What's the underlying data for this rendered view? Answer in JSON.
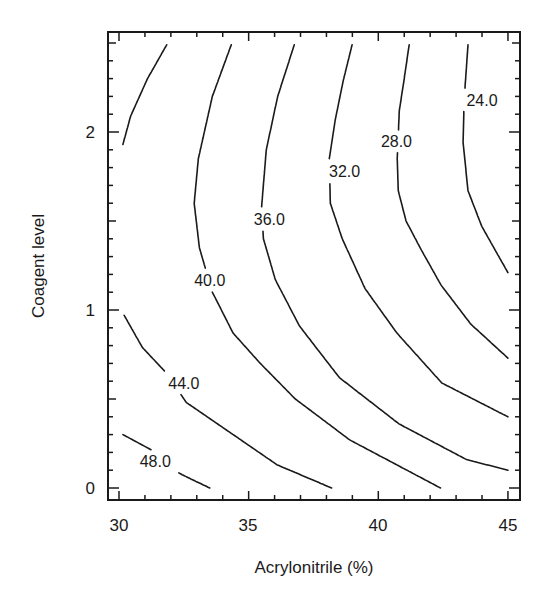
{
  "chart_data": {
    "type": "contour",
    "title": "",
    "xlabel": "Acrylonitrile (%)",
    "ylabel": "Coagent level",
    "xlim": [
      29.6,
      45.45
    ],
    "ylim": [
      -0.07,
      2.56
    ],
    "x_ticks": [
      30,
      35,
      40,
      45
    ],
    "x_tick_labels": [
      "30",
      "35",
      "40",
      "45"
    ],
    "x_minor_step": 1,
    "y_ticks": [
      0,
      1,
      2
    ],
    "y_tick_labels": [
      "0",
      "1",
      "2"
    ],
    "y_minor_step": 0.1,
    "y_mid_ticks": [
      0.5,
      1.5,
      2.5
    ],
    "grid": false,
    "legend": "none",
    "contour_levels": [
      24.0,
      28.0,
      32.0,
      36.0,
      40.0,
      44.0,
      48.0
    ],
    "contour_labels": [
      "24.0",
      "28.0",
      "32.0",
      "36.0",
      "40.0",
      "44.0",
      "48.0"
    ],
    "contours": [
      {
        "level": 24.0,
        "label": "24.0",
        "label_at": [
          44.0,
          2.18
        ],
        "points": [
          [
            43.46,
            2.49
          ],
          [
            43.31,
            2.18
          ],
          [
            43.27,
            1.94
          ],
          [
            43.46,
            1.67
          ],
          [
            43.99,
            1.47
          ],
          [
            44.61,
            1.31
          ],
          [
            45.0,
            1.21
          ]
        ]
      },
      {
        "level": 28.0,
        "label": "28.0",
        "label_at": [
          40.7,
          1.95
        ],
        "points": [
          [
            41.19,
            2.49
          ],
          [
            40.99,
            2.29
          ],
          [
            40.81,
            2.12
          ],
          [
            40.73,
            1.85
          ],
          [
            40.77,
            1.67
          ],
          [
            41.07,
            1.5
          ],
          [
            41.65,
            1.34
          ],
          [
            42.42,
            1.14
          ],
          [
            43.57,
            0.92
          ],
          [
            45.0,
            0.73
          ]
        ]
      },
      {
        "level": 32.0,
        "label": "32.0",
        "label_at": [
          38.7,
          1.78
        ],
        "points": [
          [
            38.99,
            2.49
          ],
          [
            38.65,
            2.29
          ],
          [
            38.34,
            2.07
          ],
          [
            38.11,
            1.85
          ],
          [
            38.15,
            1.6
          ],
          [
            38.61,
            1.4
          ],
          [
            39.49,
            1.12
          ],
          [
            40.72,
            0.87
          ],
          [
            42.45,
            0.59
          ],
          [
            45.0,
            0.4
          ]
        ]
      },
      {
        "level": 36.0,
        "label": "36.0",
        "label_at": [
          35.8,
          1.51
        ],
        "points": [
          [
            36.76,
            2.49
          ],
          [
            36.12,
            2.2
          ],
          [
            35.68,
            1.9
          ],
          [
            35.5,
            1.58
          ],
          [
            35.57,
            1.4
          ],
          [
            36.03,
            1.17
          ],
          [
            36.96,
            0.91
          ],
          [
            38.5,
            0.62
          ],
          [
            40.8,
            0.36
          ],
          [
            43.4,
            0.16
          ],
          [
            45.0,
            0.1
          ]
        ]
      },
      {
        "level": 40.0,
        "label": "40.0",
        "label_at": [
          33.5,
          1.17
        ],
        "points": [
          [
            34.33,
            2.49
          ],
          [
            33.6,
            2.2
          ],
          [
            33.06,
            1.85
          ],
          [
            32.9,
            1.6
          ],
          [
            33.1,
            1.35
          ],
          [
            33.6,
            1.1
          ],
          [
            34.4,
            0.87
          ],
          [
            35.45,
            0.7
          ],
          [
            36.8,
            0.5
          ],
          [
            38.9,
            0.27
          ],
          [
            42.4,
            0.0
          ]
        ]
      },
      {
        "level": 44.0,
        "label": "44.0",
        "label_at": [
          32.5,
          0.59
        ],
        "points": [
          [
            31.84,
            2.49
          ],
          [
            31.1,
            2.3
          ],
          [
            30.45,
            2.09
          ],
          [
            30.15,
            1.93
          ]
        ]
      },
      {
        "level": 44.0,
        "label": "44.0",
        "label_at": [
          32.5,
          0.59
        ],
        "points": [
          [
            30.2,
            0.97
          ],
          [
            30.9,
            0.79
          ],
          [
            31.8,
            0.65
          ],
          [
            32.6,
            0.48
          ],
          [
            33.4,
            0.4
          ],
          [
            34.7,
            0.27
          ],
          [
            36.1,
            0.13
          ],
          [
            38.2,
            0.0
          ]
        ]
      },
      {
        "level": 48.0,
        "label": "48.0",
        "label_at": [
          31.4,
          0.15
        ],
        "points": [
          [
            30.15,
            0.3
          ],
          [
            31.3,
            0.21
          ],
          [
            31.6,
            0.14
          ],
          [
            32.5,
            0.07
          ],
          [
            33.5,
            0.0
          ]
        ]
      }
    ]
  }
}
